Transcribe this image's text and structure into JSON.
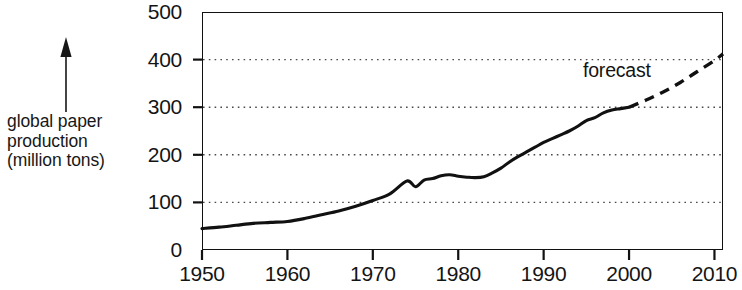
{
  "chart_data": {
    "type": "line",
    "title": "",
    "subtitle": "",
    "xlabel": "",
    "ylabel": "global paper production (million tons)",
    "ylabel_lines": [
      "global paper",
      "production",
      "(million tons)"
    ],
    "xlim": [
      1950,
      2011
    ],
    "ylim": [
      0,
      500
    ],
    "yticks": [
      0,
      100,
      200,
      300,
      400,
      500
    ],
    "ytick_labels": [
      "0",
      "100",
      "200",
      "300",
      "400",
      "500"
    ],
    "xticks": [
      1950,
      1960,
      1970,
      1980,
      1990,
      2000,
      2010
    ],
    "xtick_labels": [
      "1950",
      "1960",
      "1970",
      "1980",
      "1990",
      "2000",
      "2010"
    ],
    "grid": "horizontal-dotted",
    "legend": "none",
    "annotations": [
      {
        "text": "forecast",
        "x": 2001,
        "y": 385
      }
    ],
    "series": [
      {
        "name": "historical",
        "style": "solid",
        "color": "#111111",
        "x": [
          1950,
          1952,
          1954,
          1956,
          1958,
          1960,
          1962,
          1964,
          1966,
          1968,
          1970,
          1972,
          1974,
          1975,
          1976,
          1977,
          1978,
          1979,
          1980,
          1981,
          1982,
          1983,
          1984,
          1985,
          1986,
          1987,
          1988,
          1989,
          1990,
          1991,
          1992,
          1993,
          1994,
          1995,
          1996,
          1997,
          1998,
          1999,
          2000
        ],
        "y": [
          45,
          48,
          52,
          56,
          58,
          60,
          66,
          74,
          82,
          92,
          104,
          118,
          145,
          133,
          147,
          150,
          156,
          158,
          155,
          153,
          152,
          154,
          162,
          172,
          185,
          196,
          206,
          216,
          226,
          234,
          242,
          250,
          260,
          272,
          278,
          288,
          294,
          297,
          300
        ]
      },
      {
        "name": "forecast",
        "style": "dashed",
        "color": "#111111",
        "x": [
          2000,
          2002,
          2004,
          2006,
          2008,
          2010,
          2011
        ],
        "y": [
          300,
          315,
          332,
          352,
          375,
          398,
          412
        ]
      }
    ]
  },
  "axis_annotation": {
    "arrow_icon": "up-arrow-icon",
    "line1": "global paper",
    "line2": "production",
    "line3": "(million tons)"
  },
  "forecast": {
    "label": "forecast"
  },
  "colors": {
    "line": "#111111",
    "frame": "#111111",
    "grid": "#4a4a4a",
    "background": "#ffffff",
    "text": "#141414"
  }
}
